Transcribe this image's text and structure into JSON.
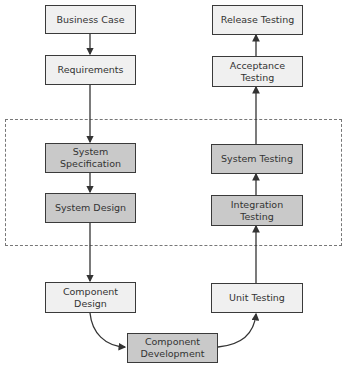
{
  "diagram": {
    "type": "V-model flowchart",
    "group": {
      "label": "",
      "style": "dashed",
      "contains": [
        "system_spec",
        "system_design",
        "system_testing",
        "integration_testing"
      ]
    },
    "nodes": {
      "business_case": {
        "label": "Business Case",
        "shade": "light"
      },
      "requirements": {
        "label": "Requirements",
        "shade": "light"
      },
      "system_spec": {
        "label": "System Specification",
        "shade": "dark"
      },
      "system_design": {
        "label": "System Design",
        "shade": "dark"
      },
      "component_design": {
        "label": "Component Design",
        "shade": "light"
      },
      "component_development": {
        "label": "Component Development",
        "shade": "dark"
      },
      "unit_testing": {
        "label": "Unit Testing",
        "shade": "light"
      },
      "integration_testing": {
        "label": "Integration Testing",
        "shade": "dark"
      },
      "system_testing": {
        "label": "System Testing",
        "shade": "dark"
      },
      "acceptance_testing": {
        "label": "Acceptance Testing",
        "shade": "light"
      },
      "release_testing": {
        "label": "Release Testing",
        "shade": "light"
      }
    },
    "edges": [
      [
        "business_case",
        "requirements"
      ],
      [
        "requirements",
        "system_spec"
      ],
      [
        "system_spec",
        "system_design"
      ],
      [
        "system_design",
        "component_design"
      ],
      [
        "component_design",
        "component_development"
      ],
      [
        "component_development",
        "unit_testing"
      ],
      [
        "unit_testing",
        "integration_testing"
      ],
      [
        "integration_testing",
        "system_testing"
      ],
      [
        "system_testing",
        "acceptance_testing"
      ],
      [
        "acceptance_testing",
        "release_testing"
      ]
    ],
    "colors": {
      "light_fill": "#f0f0f0",
      "dark_fill": "#c9c9c9",
      "border": "#3a3a3a",
      "dash": "#777777"
    }
  }
}
